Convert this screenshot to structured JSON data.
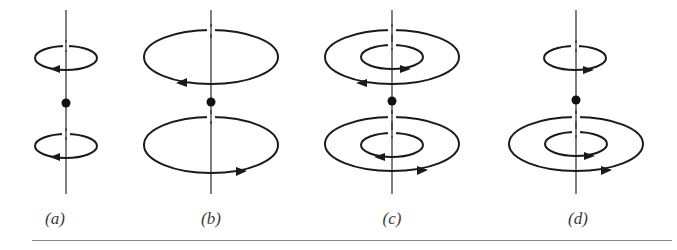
{
  "figure": {
    "colors": {
      "stroke": "#1a1a1a",
      "axis": "#2a2a2a",
      "rule": "#8a8a8a",
      "label": "#3a3a3a"
    },
    "panels": [
      {
        "id": "a",
        "label": "(a)",
        "axis_x": 66,
        "top_loops": [
          {
            "size": "small",
            "direction": "left"
          }
        ],
        "bottom_loops": [
          {
            "size": "small",
            "direction": "left"
          }
        ]
      },
      {
        "id": "b",
        "label": "(b)",
        "axis_x": 211,
        "top_loops": [
          {
            "size": "large",
            "direction": "left"
          }
        ],
        "bottom_loops": [
          {
            "size": "large",
            "direction": "right"
          }
        ]
      },
      {
        "id": "c",
        "label": "(c)",
        "axis_x": 392,
        "top_loops": [
          {
            "size": "large",
            "direction": "left"
          },
          {
            "size": "small",
            "direction": "right"
          }
        ],
        "bottom_loops": [
          {
            "size": "large",
            "direction": "right"
          },
          {
            "size": "small",
            "direction": "left"
          }
        ]
      },
      {
        "id": "d",
        "label": "(d)",
        "axis_x": 576,
        "top_loops": [
          {
            "size": "small",
            "direction": "right"
          }
        ],
        "bottom_loops": [
          {
            "size": "large",
            "direction": "right"
          },
          {
            "size": "small",
            "direction": "right"
          }
        ]
      }
    ]
  }
}
